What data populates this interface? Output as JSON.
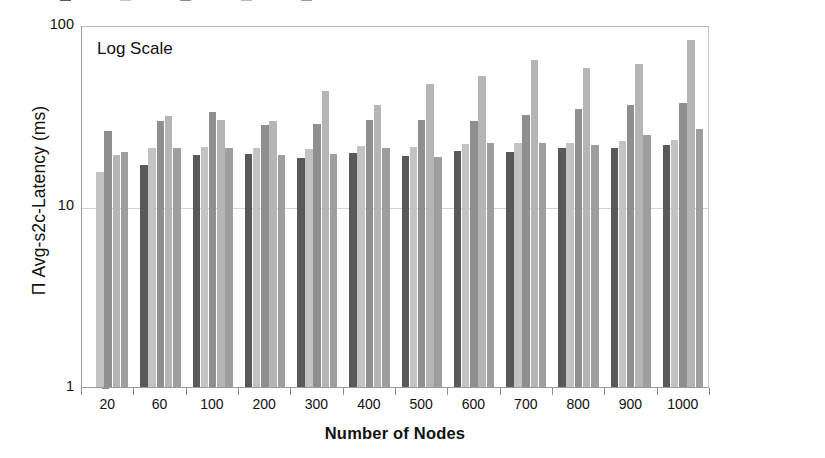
{
  "chart_data": {
    "type": "bar",
    "title": "",
    "annotation": "Log Scale",
    "xlabel": "Number of Nodes",
    "ylabel": "Π Avg-s2c-Latency (ms)",
    "yscale": "log",
    "ylim": [
      1,
      100
    ],
    "ytick_labels": [
      "100",
      "10",
      "1"
    ],
    "ytick_values": [
      100,
      10,
      1
    ],
    "grid": true,
    "legend_position": "top (clipped)",
    "legend_clipped": true,
    "categories": [
      "20",
      "60",
      "100",
      "200",
      "300",
      "400",
      "500",
      "600",
      "700",
      "800",
      "900",
      "1000"
    ],
    "series": [
      {
        "name": "Series 1",
        "color": "#595959",
        "values": [
          null,
          16.8,
          19.2,
          19.4,
          18.5,
          19.6,
          19.0,
          20.2,
          19.8,
          20.8,
          21.0,
          21.8
        ]
      },
      {
        "name": "Series 2",
        "color": "#c3c3c3",
        "values": [
          15.5,
          21.0,
          21.2,
          21.0,
          20.6,
          21.4,
          21.2,
          22.0,
          22.4,
          22.4,
          23.0,
          23.2
        ]
      },
      {
        "name": "Series 3",
        "color": "#8f8f8f",
        "values": [
          26.0,
          29.5,
          33.0,
          28.0,
          28.5,
          30.0,
          30.0,
          29.5,
          32.0,
          34.5,
          36.0,
          37.0
        ]
      },
      {
        "name": "Series 4",
        "color": "#b5b5b5",
        "values": [
          19.2,
          31.5,
          30.0,
          29.5,
          43.0,
          36.0,
          47.0,
          52.0,
          64.0,
          58.0,
          61.0,
          83.0
        ]
      },
      {
        "name": "Series 5",
        "color": "#9e9e9e",
        "values": [
          20.0,
          20.8,
          20.8,
          19.2,
          19.4,
          21.0,
          18.6,
          22.2,
          22.4,
          21.6,
          24.6,
          26.5
        ]
      }
    ]
  },
  "legend": {
    "items": [
      {
        "label": "",
        "color": "#595959"
      },
      {
        "label": "",
        "color": "#c3c3c3"
      },
      {
        "label": "",
        "color": "#8f8f8f"
      },
      {
        "label": "",
        "color": "#b5b5b5"
      },
      {
        "label": "",
        "color": "#9e9e9e"
      }
    ]
  },
  "colors": {
    "axis": "#9a9a9a",
    "grid": "#d2d2d2",
    "text": "#111111",
    "background": "#ffffff"
  }
}
